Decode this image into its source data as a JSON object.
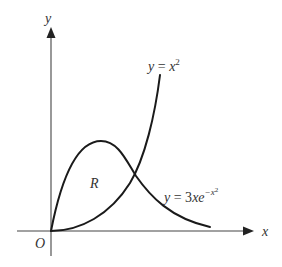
{
  "diagram": {
    "type": "function-graph",
    "axes": {
      "x_label": "x",
      "y_label": "y",
      "origin_label": "O"
    },
    "curves": [
      {
        "id": "parabola",
        "label_y": "y",
        "label_eq": " = ",
        "label_base": "x",
        "label_exp": "2"
      },
      {
        "id": "gaussian",
        "label_y": "y",
        "label_eq": " = 3",
        "label_base": "xe",
        "label_exp": "−x",
        "label_exp2": "2"
      }
    ],
    "region_label": "R",
    "colors": {
      "curve": "#1a1a1a",
      "axis": "#444444",
      "text": "#333333",
      "background": "#ffffff"
    }
  }
}
